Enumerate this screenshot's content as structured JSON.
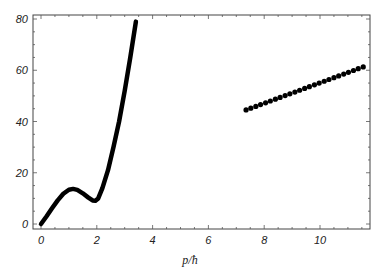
{
  "chart_data": {
    "type": "line",
    "title": "",
    "xlabel": "p/ħ",
    "ylabel": "",
    "xlim": [
      -0.3,
      11.8
    ],
    "ylim": [
      -2,
      81
    ],
    "xticks": [
      0,
      2,
      4,
      6,
      8,
      10
    ],
    "yticks": [
      0,
      20,
      40,
      60,
      80
    ],
    "grid": false,
    "legend": null,
    "series": [
      {
        "name": "continuous curve",
        "style": "line",
        "x": [
          0,
          0.2,
          0.4,
          0.6,
          0.8,
          1.0,
          1.15,
          1.3,
          1.5,
          1.7,
          1.85,
          1.95,
          2.05,
          2.2,
          2.4,
          2.6,
          2.8,
          3.0,
          3.2,
          3.4
        ],
        "y": [
          0,
          3,
          6.2,
          9.2,
          11.8,
          13.4,
          13.7,
          13.3,
          12,
          10.3,
          9.2,
          9.1,
          10,
          14,
          21,
          30,
          40,
          52,
          65,
          79
        ]
      },
      {
        "name": "discrete points",
        "style": "scatter",
        "x": [
          7.35,
          7.52,
          7.7,
          7.87,
          8.05,
          8.22,
          8.4,
          8.57,
          8.75,
          8.92,
          9.1,
          9.27,
          9.45,
          9.62,
          9.8,
          9.97,
          10.15,
          10.32,
          10.5,
          10.67,
          10.85,
          11.02,
          11.2,
          11.37,
          11.55
        ],
        "y": [
          44.5,
          45.2,
          45.9,
          46.6,
          47.3,
          48.0,
          48.7,
          49.4,
          50.1,
          50.8,
          51.5,
          52.2,
          52.9,
          53.6,
          54.3,
          55.0,
          55.7,
          56.4,
          57.1,
          57.8,
          58.5,
          59.2,
          59.9,
          60.6,
          61.3
        ]
      }
    ]
  },
  "axes": {
    "x_title": "p/ħ",
    "x_tick_labels": [
      "0",
      "2",
      "4",
      "6",
      "8",
      "10"
    ],
    "y_tick_labels": [
      "0",
      "20",
      "40",
      "60",
      "80"
    ]
  }
}
